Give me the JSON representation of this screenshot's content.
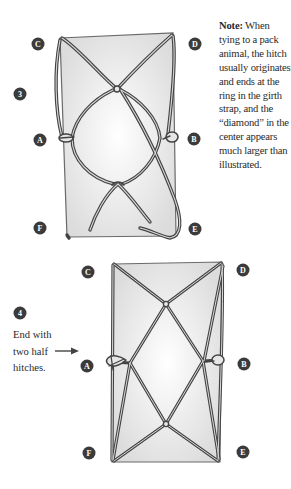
{
  "figure3": {
    "step_number": "3",
    "corner_labels": {
      "C": "C",
      "D": "D",
      "A": "A",
      "B": "B",
      "F": "F",
      "E": "E"
    },
    "note": {
      "heading": "Note:",
      "body": "When tying to a pack animal, the hitch usually originates and ends at the ring in the girth strap, and the “diamond” in the center appears much larger than illustrated."
    }
  },
  "figure4": {
    "step_number": "4",
    "corner_labels": {
      "C": "C",
      "D": "D",
      "A": "A",
      "B": "B",
      "F": "F",
      "E": "E"
    },
    "caption": "End with two half hitches.",
    "arrow_icon": "right-arrow-icon"
  },
  "colors": {
    "badge_fill": "#3b3b3b",
    "rope": "#4a4a4a",
    "rope_highlight": "#d8d8d8",
    "pack_fill": "#e9e9e9",
    "pack_edge": "#6a6a6a",
    "text": "#2a2a2a"
  }
}
